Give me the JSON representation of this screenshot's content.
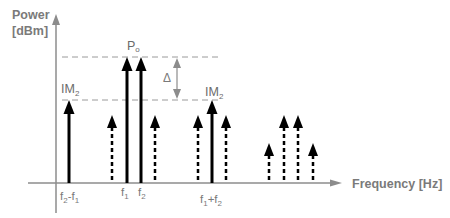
{
  "diagram": {
    "y_axis_label_line1": "Power",
    "y_axis_label_line2": "[dBm]",
    "x_axis_label": "Frequency [Hz]",
    "labels": {
      "po": "P",
      "po_sub": "o",
      "im2_left": "IM",
      "im2_left_sub": "2",
      "im2_right": "IM",
      "im2_right_sub": "2",
      "delta": "Δ",
      "f2_minus_f1": {
        "a": "f",
        "a_sub": "2",
        "sep": "-f",
        "b_sub": "1"
      },
      "f1": {
        "a": "f",
        "a_sub": "1"
      },
      "f2": {
        "a": "f",
        "a_sub": "2"
      },
      "f1_plus_f2": {
        "a": "f",
        "a_sub": "1",
        "sep": "+f",
        "b_sub": "2"
      }
    },
    "colors": {
      "axis": "#8c8c8c",
      "arrow": "#000000",
      "guide_dash": "#9a9a9a",
      "delta_arrow": "#8c8c8c",
      "text": "#7a7a7a"
    },
    "components": [
      {
        "name": "f2-f1",
        "x": 69,
        "level": "IM2",
        "style": "solid"
      },
      {
        "name": "spur",
        "x": 112,
        "level": "low",
        "style": "dashed"
      },
      {
        "name": "f1",
        "x": 127,
        "level": "Po",
        "style": "solid"
      },
      {
        "name": "f2",
        "x": 141,
        "level": "Po",
        "style": "solid"
      },
      {
        "name": "spur",
        "x": 155,
        "level": "low",
        "style": "dashed"
      },
      {
        "name": "spur",
        "x": 198,
        "level": "low",
        "style": "dashed"
      },
      {
        "name": "f1+f2",
        "x": 212,
        "level": "IM2",
        "style": "solid"
      },
      {
        "name": "spur",
        "x": 226,
        "level": "low",
        "style": "dashed"
      },
      {
        "name": "spur",
        "x": 269,
        "level": "lower",
        "style": "dashed"
      },
      {
        "name": "spur",
        "x": 284,
        "level": "low",
        "style": "dashed"
      },
      {
        "name": "spur",
        "x": 298,
        "level": "low",
        "style": "dashed"
      },
      {
        "name": "spur",
        "x": 313,
        "level": "lower",
        "style": "dashed"
      }
    ]
  }
}
